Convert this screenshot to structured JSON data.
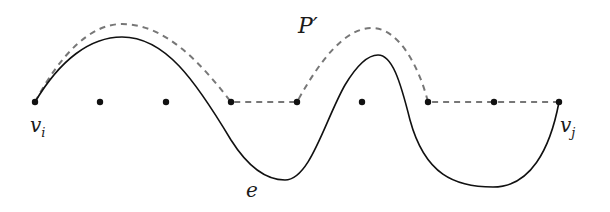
{
  "diagram": {
    "labels": {
      "start_vertex": "v",
      "start_sub": "i",
      "end_vertex": "v",
      "end_sub": "j",
      "path": "P′",
      "edge": "e"
    },
    "vertices_x": [
      35,
      100,
      166,
      231,
      297,
      362,
      428,
      494,
      559
    ],
    "vertex_y": 102,
    "colors": {
      "solid": "#111111",
      "dashed": "#777777",
      "vertex": "#111111"
    }
  }
}
